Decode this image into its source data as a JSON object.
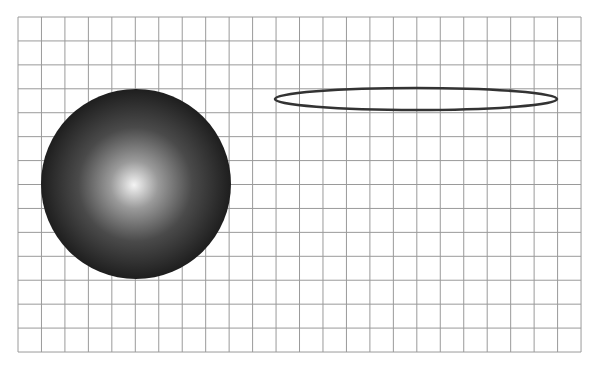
{
  "canvas": {
    "width": 595,
    "height": 376,
    "background": "#ffffff"
  },
  "grid": {
    "x": 18,
    "y": 17,
    "columns": 24,
    "rows": 14,
    "cell_width": 23.46,
    "cell_height": 23.93,
    "line_color": "#9a9a9a",
    "line_width": 1
  },
  "sphere": {
    "cx": 136,
    "cy": 184,
    "r": 95,
    "highlight_cx": 134,
    "highlight_cy": 185,
    "gradient_stops": [
      {
        "offset": "0%",
        "color": "#f4f4f4"
      },
      {
        "offset": "25%",
        "color": "#9a9a9a"
      },
      {
        "offset": "60%",
        "color": "#4a4a4a"
      },
      {
        "offset": "100%",
        "color": "#1e1e1e"
      }
    ]
  },
  "ellipse": {
    "cx": 416,
    "cy": 99,
    "rx": 141,
    "ry": 11,
    "stroke": "#333333",
    "stroke_width": 2.6,
    "fill": "none"
  }
}
